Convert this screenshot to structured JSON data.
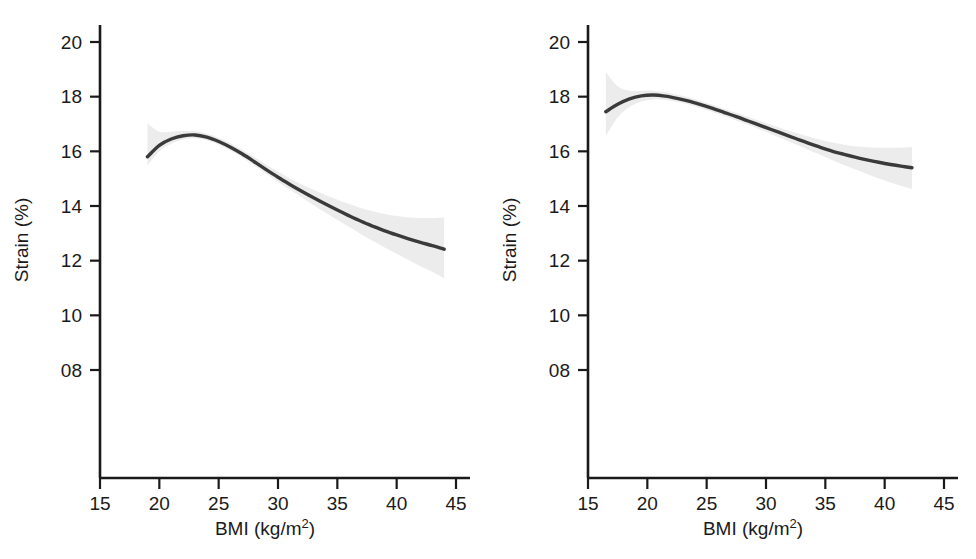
{
  "figure": {
    "background_color": "#ffffff",
    "panel_count": 2,
    "line_color": "#3a3a3a",
    "band_color": "#ececec",
    "axis_color": "#1a1a1a"
  },
  "chart_data": [
    {
      "type": "line",
      "panel": "left",
      "title": "",
      "xlabel": "BMI (kg/m",
      "xlabel_sup": "2",
      "xlabel_tail": ")",
      "xlabel_full": "BMI (kg/m2)",
      "ylabel": "Strain (%)",
      "xlim": [
        15,
        45
      ],
      "ylim": [
        8,
        20
      ],
      "xticks": [
        15,
        20,
        25,
        30,
        35,
        40,
        45
      ],
      "xticklabels": [
        "15",
        "20",
        "25",
        "30",
        "35",
        "40",
        "45"
      ],
      "yticks": [
        8,
        10,
        12,
        14,
        16,
        18,
        20
      ],
      "yticklabels": [
        "08",
        "10",
        "12",
        "14",
        "16",
        "18",
        "20"
      ],
      "grid": false,
      "legend": "none",
      "series": [
        {
          "name": "fitted strain",
          "x": [
            19.0,
            20.0,
            21.0,
            22.0,
            23.0,
            24.0,
            25.0,
            26.0,
            27.0,
            28.0,
            29.0,
            30.0,
            31.0,
            32.0,
            33.0,
            34.0,
            35.0,
            36.0,
            37.0,
            38.0,
            39.0,
            40.0,
            41.0,
            42.0,
            43.0,
            44.0
          ],
          "values": [
            15.8,
            16.22,
            16.45,
            16.57,
            16.6,
            16.52,
            16.36,
            16.15,
            15.9,
            15.62,
            15.33,
            15.05,
            14.79,
            14.54,
            14.3,
            14.07,
            13.85,
            13.64,
            13.44,
            13.26,
            13.09,
            12.94,
            12.8,
            12.67,
            12.55,
            12.42
          ],
          "ci_lower": [
            15.48,
            16.0,
            16.28,
            16.43,
            16.48,
            16.41,
            16.25,
            16.03,
            15.77,
            15.48,
            15.18,
            14.88,
            14.59,
            14.31,
            14.03,
            13.76,
            13.49,
            13.23,
            12.97,
            12.72,
            12.48,
            12.25,
            12.02,
            11.8,
            11.59,
            11.35
          ],
          "ci_upper": [
            17.02,
            16.72,
            16.72,
            16.74,
            16.74,
            16.65,
            16.49,
            16.29,
            16.05,
            15.79,
            15.52,
            15.25,
            15.01,
            14.79,
            14.59,
            14.4,
            14.23,
            14.07,
            13.93,
            13.81,
            13.71,
            13.63,
            13.58,
            13.56,
            13.56,
            13.58
          ]
        }
      ]
    },
    {
      "type": "line",
      "panel": "right",
      "title": "",
      "xlabel": "BMI (kg/m",
      "xlabel_sup": "2",
      "xlabel_tail": ")",
      "xlabel_full": "BMI (kg/m2)",
      "ylabel": "Strain (%)",
      "xlim": [
        15,
        45
      ],
      "ylim": [
        8,
        20
      ],
      "xticks": [
        15,
        20,
        25,
        30,
        35,
        40,
        45
      ],
      "xticklabels": [
        "15",
        "20",
        "25",
        "30",
        "35",
        "40",
        "45"
      ],
      "yticks": [
        8,
        10,
        12,
        14,
        16,
        18,
        20
      ],
      "yticklabels": [
        "08",
        "10",
        "12",
        "14",
        "16",
        "18",
        "20"
      ],
      "grid": false,
      "legend": "none",
      "series": [
        {
          "name": "fitted strain",
          "x": [
            16.5,
            17.5,
            18.5,
            19.5,
            20.5,
            21.5,
            22.5,
            23.5,
            24.5,
            25.5,
            26.5,
            27.5,
            28.5,
            29.5,
            30.5,
            31.5,
            32.5,
            33.5,
            34.5,
            35.5,
            36.5,
            37.5,
            38.5,
            39.5,
            40.5,
            41.5,
            42.3
          ],
          "values": [
            17.45,
            17.72,
            17.92,
            18.03,
            18.06,
            18.02,
            17.94,
            17.84,
            17.71,
            17.57,
            17.42,
            17.27,
            17.11,
            16.95,
            16.79,
            16.63,
            16.47,
            16.31,
            16.16,
            16.02,
            15.9,
            15.79,
            15.69,
            15.6,
            15.52,
            15.45,
            15.4
          ],
          "ci_lower": [
            16.56,
            17.24,
            17.62,
            17.82,
            17.9,
            17.88,
            17.81,
            17.71,
            17.58,
            17.44,
            17.29,
            17.13,
            16.97,
            16.8,
            16.62,
            16.44,
            16.26,
            16.07,
            15.88,
            15.69,
            15.51,
            15.34,
            15.17,
            15.01,
            14.86,
            14.72,
            14.62
          ],
          "ci_upper": [
            18.9,
            18.38,
            18.22,
            18.22,
            18.22,
            18.16,
            18.07,
            17.97,
            17.84,
            17.7,
            17.55,
            17.41,
            17.26,
            17.11,
            16.96,
            16.82,
            16.68,
            16.55,
            16.43,
            16.33,
            16.25,
            16.19,
            16.15,
            16.13,
            16.13,
            16.14,
            16.16
          ]
        }
      ]
    }
  ]
}
